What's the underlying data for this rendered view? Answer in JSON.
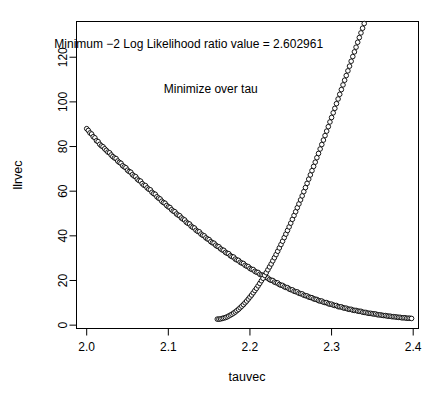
{
  "chart_data": {
    "type": "scatter",
    "title": "",
    "xlabel": "tauvec",
    "ylabel": "llrvec",
    "xlim": [
      1.9875,
      2.4065
    ],
    "ylim": [
      -1.5,
      136
    ],
    "grid": false,
    "legend": null,
    "marker": "open-circle",
    "marker_color": "#000000",
    "xticks": [
      "2.0",
      "2.1",
      "2.2",
      "2.3",
      "2.4"
    ],
    "xtick_values": [
      2.0,
      2.1,
      2.2,
      2.3,
      2.4
    ],
    "yticks": [
      "0",
      "20",
      "40",
      "60",
      "80",
      "100",
      "120"
    ],
    "ytick_values": [
      0,
      20,
      40,
      60,
      80,
      100,
      120
    ],
    "annotations": [
      {
        "name": "minimum-value-annotation",
        "text": "Minimum −2 Log Likelihood ratio value = 2.602961",
        "x": 2.125,
        "y": 124
      },
      {
        "name": "minimize-over-tau-annotation",
        "text": "Minimize over tau",
        "x": 2.152,
        "y": 104
      }
    ],
    "minimum": {
      "value": 2.602961,
      "tau": 2.155
    },
    "x": [
      2.0,
      2.002,
      2.004,
      2.006,
      2.008,
      2.01,
      2.012,
      2.014,
      2.016,
      2.018,
      2.02,
      2.022,
      2.024,
      2.026,
      2.028,
      2.03,
      2.032,
      2.034,
      2.036,
      2.038,
      2.04,
      2.042,
      2.044,
      2.046,
      2.048,
      2.05,
      2.052,
      2.054,
      2.056,
      2.058,
      2.06,
      2.062,
      2.064,
      2.066,
      2.068,
      2.07,
      2.072,
      2.074,
      2.076,
      2.078,
      2.08,
      2.082,
      2.084,
      2.086,
      2.088,
      2.09,
      2.092,
      2.094,
      2.096,
      2.098,
      2.1,
      2.102,
      2.104,
      2.106,
      2.108,
      2.11,
      2.112,
      2.114,
      2.116,
      2.118,
      2.12,
      2.122,
      2.124,
      2.126,
      2.128,
      2.13,
      2.132,
      2.134,
      2.136,
      2.138,
      2.14,
      2.142,
      2.144,
      2.146,
      2.148,
      2.15,
      2.152,
      2.154,
      2.156,
      2.158,
      2.16,
      2.162,
      2.164,
      2.166,
      2.168,
      2.17,
      2.172,
      2.174,
      2.176,
      2.178,
      2.18,
      2.182,
      2.184,
      2.186,
      2.188,
      2.19,
      2.192,
      2.194,
      2.196,
      2.198,
      2.2,
      2.202,
      2.204,
      2.206,
      2.208,
      2.21,
      2.212,
      2.214,
      2.216,
      2.218,
      2.22,
      2.222,
      2.224,
      2.226,
      2.228,
      2.23,
      2.232,
      2.234,
      2.236,
      2.238,
      2.24,
      2.242,
      2.244,
      2.246,
      2.248,
      2.25,
      2.252,
      2.254,
      2.256,
      2.258,
      2.26,
      2.262,
      2.264,
      2.266,
      2.268,
      2.27,
      2.272,
      2.274,
      2.276,
      2.278,
      2.28,
      2.282,
      2.284,
      2.286,
      2.288,
      2.29,
      2.292,
      2.294,
      2.296,
      2.298,
      2.3,
      2.302,
      2.304,
      2.306,
      2.308,
      2.31,
      2.312,
      2.314,
      2.316,
      2.318,
      2.32,
      2.322,
      2.324,
      2.326,
      2.328,
      2.33,
      2.332,
      2.334,
      2.336,
      2.338,
      2.34,
      2.342,
      2.344,
      2.346,
      2.348,
      2.35,
      2.352,
      2.354,
      2.356,
      2.358,
      2.36,
      2.362,
      2.364,
      2.366,
      2.368,
      2.37,
      2.372,
      2.374,
      2.376,
      2.378,
      2.38,
      2.382,
      2.384,
      2.386,
      2.388,
      2.39,
      2.392,
      2.394,
      2.396,
      2.398
    ],
    "y": [
      88.0,
      87.2,
      86.1,
      85.6,
      84.4,
      83.9,
      82.6,
      82.2,
      81.0,
      80.3,
      79.9,
      79.0,
      78.3,
      77.5,
      77.2,
      76.2,
      75.5,
      74.9,
      74.6,
      73.5,
      72.9,
      72.5,
      71.4,
      70.9,
      70.5,
      69.4,
      68.8,
      68.5,
      67.4,
      66.8,
      66.5,
      65.4,
      64.8,
      64.5,
      63.4,
      62.7,
      62.5,
      61.5,
      60.9,
      60.6,
      59.5,
      58.9,
      58.6,
      57.5,
      56.9,
      56.5,
      55.5,
      54.9,
      54.6,
      53.6,
      53.0,
      52.7,
      51.7,
      51.1,
      50.8,
      49.8,
      49.3,
      49.0,
      48.0,
      47.5,
      47.1,
      46.1,
      45.6,
      45.3,
      44.3,
      43.8,
      43.5,
      42.5,
      42.0,
      41.8,
      40.8,
      40.3,
      40.0,
      39.1,
      38.6,
      38.3,
      37.4,
      36.9,
      36.7,
      35.8,
      35.3,
      35.1,
      34.2,
      33.7,
      33.5,
      32.6,
      32.2,
      32.0,
      31.1,
      30.7,
      30.5,
      29.6,
      29.2,
      29.0,
      28.2,
      27.8,
      27.6,
      26.8,
      26.4,
      26.2,
      25.4,
      25.0,
      24.9,
      24.1,
      23.7,
      23.6,
      22.8,
      22.5,
      22.3,
      21.6,
      21.3,
      21.1,
      20.4,
      20.1,
      20.0,
      19.3,
      19.0,
      18.9,
      18.2,
      17.9,
      17.8,
      17.2,
      16.9,
      16.8,
      16.2,
      15.9,
      15.8,
      15.2,
      15.0,
      14.9,
      14.3,
      14.1,
      14.0,
      13.4,
      13.2,
      13.1,
      12.6,
      12.4,
      12.3,
      11.8,
      11.6,
      11.5,
      11.0,
      10.8,
      10.8,
      10.3,
      10.1,
      10.1,
      9.6,
      9.4,
      9.4,
      9.0,
      8.8,
      8.8,
      8.3,
      8.2,
      8.2,
      7.8,
      7.6,
      7.6,
      7.2,
      7.1,
      7.1,
      6.7,
      6.6,
      6.6,
      6.3,
      6.2,
      6.2,
      5.8,
      5.7,
      5.7,
      5.4,
      5.3,
      5.3,
      5.1,
      5.0,
      5.0,
      4.7,
      4.6,
      4.6,
      4.4,
      4.3,
      4.3,
      4.1,
      4.0,
      4.0,
      3.8,
      3.8,
      3.7,
      3.6,
      3.5,
      3.5,
      3.3,
      3.3,
      3.3,
      3.1,
      3.1,
      3.1,
      3.0
    ],
    "x_right": [
      2.16,
      2.162,
      2.164,
      2.166,
      2.168,
      2.17,
      2.172,
      2.174,
      2.176,
      2.178,
      2.18,
      2.182,
      2.184,
      2.186,
      2.188,
      2.19,
      2.192,
      2.194,
      2.196,
      2.198,
      2.2,
      2.202,
      2.204,
      2.206,
      2.208,
      2.21,
      2.212,
      2.214,
      2.216,
      2.218,
      2.22,
      2.222,
      2.224,
      2.226,
      2.228,
      2.23,
      2.232,
      2.234,
      2.236,
      2.238,
      2.24,
      2.242,
      2.244,
      2.246,
      2.248,
      2.25,
      2.252,
      2.254,
      2.256,
      2.258,
      2.26,
      2.262,
      2.264,
      2.266,
      2.268,
      2.27,
      2.272,
      2.274,
      2.276,
      2.278,
      2.28,
      2.282,
      2.284,
      2.286,
      2.288,
      2.29,
      2.292,
      2.294,
      2.296,
      2.298,
      2.3,
      2.302,
      2.304,
      2.306,
      2.308,
      2.31,
      2.312,
      2.314,
      2.316,
      2.318,
      2.32,
      2.322,
      2.324,
      2.326,
      2.328,
      2.33,
      2.332,
      2.334,
      2.336,
      2.338,
      2.34,
      2.342,
      2.344,
      2.346,
      2.348,
      2.35,
      2.352,
      2.354,
      2.356,
      2.358,
      2.36,
      2.362,
      2.364,
      2.366,
      2.368,
      2.37,
      2.372,
      2.374,
      2.376,
      2.378,
      2.38,
      2.382,
      2.384,
      2.386,
      2.388,
      2.39,
      2.392,
      2.394,
      2.396,
      2.398
    ],
    "y_right": [
      2.7,
      2.7,
      2.8,
      3.0,
      3.2,
      3.4,
      3.7,
      4.1,
      4.5,
      4.9,
      5.4,
      5.9,
      6.5,
      7.1,
      7.8,
      8.5,
      9.2,
      10.0,
      10.8,
      11.7,
      12.6,
      13.5,
      14.5,
      15.5,
      16.5,
      17.6,
      18.7,
      19.9,
      21.0,
      22.3,
      23.5,
      24.8,
      26.1,
      27.4,
      28.8,
      30.2,
      31.6,
      33.1,
      34.6,
      36.1,
      37.6,
      39.2,
      40.8,
      42.4,
      44.0,
      45.7,
      47.4,
      49.1,
      50.8,
      52.6,
      54.3,
      56.1,
      57.9,
      59.8,
      61.6,
      63.5,
      65.4,
      67.3,
      69.2,
      71.1,
      73.0,
      75.0,
      76.9,
      78.9,
      80.9,
      82.9,
      84.9,
      86.9,
      88.9,
      91.0,
      93.0,
      95.1,
      97.1,
      99.2,
      101.3,
      103.4,
      105.5,
      107.6,
      109.7,
      111.8,
      113.9,
      116.0,
      118.2,
      120.3,
      122.4,
      124.5,
      126.7,
      128.8,
      130.9,
      133.0,
      135.1,
      137.2,
      139.3,
      141.4,
      143.5,
      145.6,
      147.7,
      149.8,
      151.8,
      153.9,
      155.9,
      158.0,
      160.0,
      162.0,
      164.0,
      166.0,
      168.0,
      170.0,
      171.9,
      173.9,
      175.8,
      177.7,
      179.6,
      181.5,
      183.4,
      185.2,
      187.0,
      188.9,
      190.7,
      192.5
    ]
  }
}
